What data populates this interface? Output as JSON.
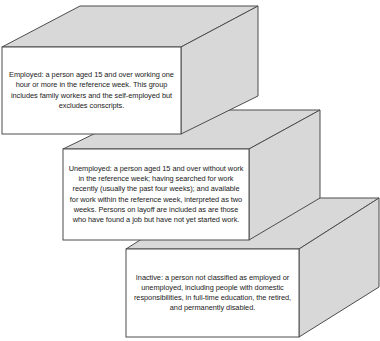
{
  "diagram": {
    "type": "stacked-3d-boxes",
    "colors": {
      "face_fill": "#d8d8d8",
      "front_fill": "#ffffff",
      "stroke": "#4d4d4d",
      "text": "#1a1a1a"
    },
    "boxes": [
      {
        "id": "employed",
        "label": "Employed",
        "text": "Employed: a person aged 15 and over working one hour or more in the reference week. This group includes family workers and the self-employed but excludes conscripts."
      },
      {
        "id": "unemployed",
        "label": "Unemployed",
        "text": "Unemployed: a person aged 15 and over without work in the reference week; having searched for work recently (usually the past four weeks); and available for work within the reference week, interpreted as two weeks. Persons on layoff are included as are those who have found a job but have not yet started work."
      },
      {
        "id": "inactive",
        "label": "Inactive",
        "text": "Inactive: a person not classified as employed or unemployed, including people with domestic responsibilities, in full-time education, the retired, and permanently disabled."
      }
    ]
  }
}
